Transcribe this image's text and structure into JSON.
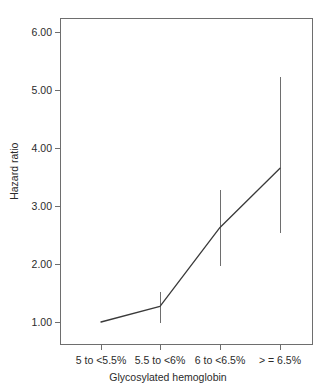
{
  "chart_data": {
    "type": "line",
    "title": "",
    "subtitle": "",
    "xlabel": "Glycosylated hemoglobin",
    "ylabel": "Hazard ratio",
    "categories": [
      "5 to <5.5%",
      "5.5 to <6%",
      "6 to <6.5%",
      "> = 6.5%"
    ],
    "values": [
      1.0,
      1.27,
      2.63,
      3.65
    ],
    "ci_lower": [
      1.0,
      0.98,
      1.97,
      2.53
    ],
    "ci_upper": [
      1.0,
      1.52,
      3.28,
      5.22
    ],
    "series": [
      {
        "name": "Hazard ratio",
        "values": [
          1.0,
          1.27,
          2.63,
          3.65
        ],
        "ci_lower": [
          1.0,
          0.98,
          1.97,
          2.53
        ],
        "ci_upper": [
          1.0,
          1.52,
          3.28,
          5.22
        ]
      }
    ],
    "yticks": [
      1.0,
      2.0,
      3.0,
      4.0,
      5.0,
      6.0
    ],
    "ytick_labels": [
      "1.00",
      "2.00",
      "3.00",
      "4.00",
      "5.00",
      "6.00"
    ],
    "ylim": [
      0.77,
      6.27
    ],
    "xlim": [
      0.5,
      4.5
    ],
    "grid": false,
    "legend": "none",
    "line_color": "#3a3a3a",
    "errorbar_color": "#6e6e6e",
    "axis_color": "#6e6e6e",
    "text_color": "#2b2b2b",
    "background": "#ffffff"
  }
}
